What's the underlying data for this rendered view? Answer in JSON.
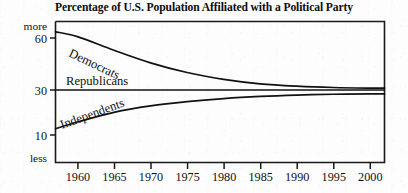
{
  "chart_data": {
    "type": "line",
    "title": "Percentage of U.S. Population Affiliated with a Political Party",
    "xlabel": "",
    "ylabel": "",
    "grid": false,
    "legend_position": "inline-curve-labels",
    "xlim": [
      1957,
      2002
    ],
    "ylim": [
      0,
      68
    ],
    "xticks": [
      1960,
      1965,
      1970,
      1975,
      1980,
      1985,
      1990,
      1995,
      2000
    ],
    "xtick_labels": [
      "1960",
      "1965",
      "1970",
      "1975",
      "1980",
      "1985",
      "1990",
      "1995",
      "2000"
    ],
    "yticks": [
      10,
      30,
      60
    ],
    "ytick_labels": [
      "10",
      "30",
      "60"
    ],
    "y_axis_top_label": "more",
    "y_axis_bottom_label": "less",
    "x": [
      1957,
      1960,
      1965,
      1970,
      1975,
      1980,
      1985,
      1990,
      1995,
      2000,
      2002
    ],
    "series": [
      {
        "name": "Democrats",
        "label": "Democrats",
        "color": "#111111",
        "values": [
          60,
          57.5,
          50.5,
          44,
          39,
          35.5,
          33.2,
          32,
          31.3,
          31,
          31
        ]
      },
      {
        "name": "Republicans",
        "label": "Republicans",
        "color": "#111111",
        "values": [
          30,
          30,
          30,
          30,
          30,
          30,
          30,
          30,
          30,
          30,
          30
        ]
      },
      {
        "name": "Independents",
        "label": "Independents",
        "color": "#111111",
        "values": [
          10,
          13.5,
          18.5,
          21.8,
          24,
          25.6,
          26.7,
          27.4,
          27.8,
          28,
          28
        ]
      }
    ]
  },
  "axis": {
    "top_label": "more",
    "bottom_label": "less",
    "y_60": "60",
    "y_30": "30",
    "y_10": "10",
    "x_1960": "1960",
    "x_1965": "1965",
    "x_1970": "1970",
    "x_1975": "1975",
    "x_1980": "1980",
    "x_1985": "1985",
    "x_1990": "1990",
    "x_1995": "1995",
    "x_2000": "2000"
  },
  "labels": {
    "democrats": "Democrats",
    "republicans": "Republicans",
    "independents": "Independents"
  }
}
